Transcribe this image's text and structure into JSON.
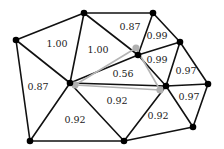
{
  "diagram": {
    "type": "triangulated-mesh",
    "colors": {
      "edge": "#111111",
      "gray_edge": "#b4b4b4",
      "vertex": "#000000",
      "gray_vertex": "#b0b0b0"
    },
    "vertices": [
      {
        "id": "v1",
        "x": 16,
        "y": 40
      },
      {
        "id": "v2",
        "x": 84,
        "y": 13
      },
      {
        "id": "v3",
        "x": 153,
        "y": 13
      },
      {
        "id": "v4",
        "x": 180,
        "y": 42
      },
      {
        "id": "v5",
        "x": 138,
        "y": 55
      },
      {
        "id": "v6",
        "x": 70,
        "y": 83
      },
      {
        "id": "v7",
        "x": 166,
        "y": 86
      },
      {
        "id": "v8",
        "x": 208,
        "y": 84
      },
      {
        "id": "v9",
        "x": 30,
        "y": 141
      },
      {
        "id": "v10",
        "x": 124,
        "y": 141
      },
      {
        "id": "v11",
        "x": 193,
        "y": 127
      }
    ],
    "gray_vertices": [
      {
        "id": "g5",
        "x": 136,
        "y": 48
      },
      {
        "id": "g6",
        "x": 75,
        "y": 85
      },
      {
        "id": "g7",
        "x": 160,
        "y": 90
      }
    ],
    "gray_edges": [
      {
        "from": "g6",
        "to": "g5"
      },
      {
        "from": "g5",
        "to": "g7"
      },
      {
        "from": "g7",
        "to": "g6"
      }
    ],
    "face_labels": [
      {
        "text": "1.00",
        "x": 57,
        "y": 44
      },
      {
        "text": "1.00",
        "x": 98,
        "y": 50
      },
      {
        "text": "0.87",
        "x": 130,
        "y": 27
      },
      {
        "text": "0.99",
        "x": 157,
        "y": 36
      },
      {
        "text": "0.99",
        "x": 157,
        "y": 60
      },
      {
        "text": "0.56",
        "x": 123,
        "y": 74
      },
      {
        "text": "0.97",
        "x": 186,
        "y": 71
      },
      {
        "text": "0.87",
        "x": 38,
        "y": 87
      },
      {
        "text": "0.92",
        "x": 75,
        "y": 120
      },
      {
        "text": "0.92",
        "x": 117,
        "y": 101
      },
      {
        "text": "0.97",
        "x": 189,
        "y": 97
      },
      {
        "text": "0.92",
        "x": 158,
        "y": 116
      }
    ]
  }
}
